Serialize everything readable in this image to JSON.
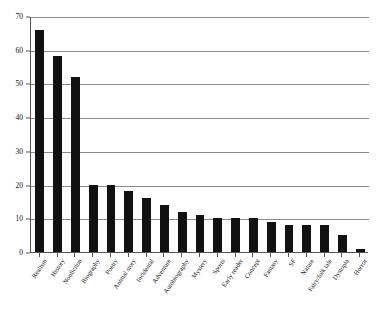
{
  "chart_data": {
    "type": "bar",
    "title": "",
    "subtitle": "",
    "xlabel": "",
    "ylabel": "",
    "ylim": [
      0,
      70
    ],
    "ytick_labels": [
      "0",
      "10",
      "20",
      "30",
      "40",
      "50",
      "60",
      "70"
    ],
    "ytick_values": [
      0,
      10,
      20,
      30,
      40,
      50,
      60,
      70
    ],
    "grid": true,
    "legend": false,
    "legend_position": "none",
    "bar_color": "#111111",
    "axis_color": "#555555",
    "gridline_color": "#8a8a8a",
    "categories": [
      "Realism",
      "History",
      "Nonfiction",
      "Biography",
      "Poetry",
      "Animal story",
      "Incidental",
      "Adventure",
      "Autobiography",
      "Mystery",
      "Sports",
      "Early reader",
      "Concept",
      "Fantasy",
      "SF",
      "Nature",
      "Fairy/folk tale",
      "Dystopia",
      "Horror"
    ],
    "values": [
      66,
      58,
      52,
      20,
      20,
      18,
      16,
      14,
      12,
      11,
      10,
      10,
      10,
      9,
      8,
      8,
      8,
      5,
      1
    ]
  }
}
